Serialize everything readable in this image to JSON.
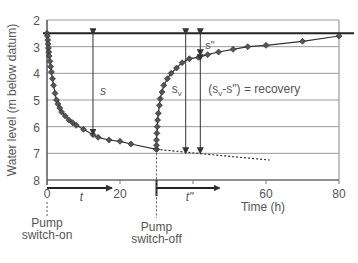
{
  "chart_data": {
    "type": "line",
    "title": "",
    "xlabel": "Time (h)",
    "ylabel": "Water level (m below datum)",
    "xlim": [
      0,
      80
    ],
    "ylim": [
      8,
      2
    ],
    "y_inverted": true,
    "x_ticks": [
      0,
      20,
      60,
      80
    ],
    "y_ticks": [
      2,
      3,
      4,
      5,
      6,
      7,
      8
    ],
    "grid": "horizontal",
    "static_level": 2.5,
    "series": [
      {
        "name": "Drawdown (pumping)",
        "x": [
          0,
          0.1,
          0.2,
          0.3,
          0.4,
          0.5,
          0.6,
          0.8,
          1.0,
          1.2,
          1.5,
          1.8,
          2.2,
          2.6,
          3,
          3.5,
          4,
          5,
          6,
          7,
          8,
          10,
          12.6,
          14,
          17,
          20,
          23,
          30
        ],
        "y": [
          2.5,
          2.6,
          2.75,
          2.9,
          3.05,
          3.2,
          3.35,
          3.55,
          3.75,
          3.95,
          4.2,
          4.45,
          4.75,
          5.0,
          5.15,
          5.3,
          5.45,
          5.6,
          5.75,
          5.85,
          5.95,
          6.1,
          6.3,
          6.4,
          6.5,
          6.55,
          6.65,
          6.85
        ]
      },
      {
        "name": "Recovery",
        "x": [
          30,
          30,
          30,
          30.1,
          30.2,
          30.3,
          30.5,
          30.8,
          31,
          31.5,
          32,
          33,
          34,
          35.5,
          37,
          39,
          41.5,
          44,
          47,
          51,
          55,
          60,
          70,
          80
        ],
        "y": [
          6.85,
          6.7,
          6.5,
          6.25,
          6.0,
          5.75,
          5.5,
          5.2,
          4.95,
          4.7,
          4.45,
          4.2,
          4.0,
          3.8,
          3.6,
          3.45,
          3.4,
          3.3,
          3.2,
          3.1,
          3.0,
          2.95,
          2.8,
          2.6
        ]
      },
      {
        "name": "Extrapolated drawdown",
        "style": "dashed",
        "x": [
          30,
          45,
          61
        ],
        "y": [
          6.85,
          7.05,
          7.25
        ]
      }
    ],
    "annotations": {
      "s": {
        "label": "s",
        "x": 12.6,
        "from": 2.5,
        "to": 6.3
      },
      "s_v": {
        "label": "s",
        "sub": "v",
        "x": 38,
        "from": 2.5,
        "to": 7.0
      },
      "s_res": {
        "label": "s\"",
        "x": 42,
        "from": 2.5,
        "to": 3.4
      },
      "recovery": {
        "label": "(s",
        "sub": "v",
        "rest": "-s\") = recovery",
        "x": 42,
        "from": 3.4,
        "to": 7.0
      },
      "t": {
        "label": "t",
        "from": 0,
        "to": 20
      },
      "t_dbl": {
        "label": "t\"",
        "from": 30,
        "to": 50
      },
      "pump_on": [
        "Pump",
        "switch-on"
      ],
      "pump_off": [
        "Pump",
        "switch-off"
      ]
    }
  }
}
